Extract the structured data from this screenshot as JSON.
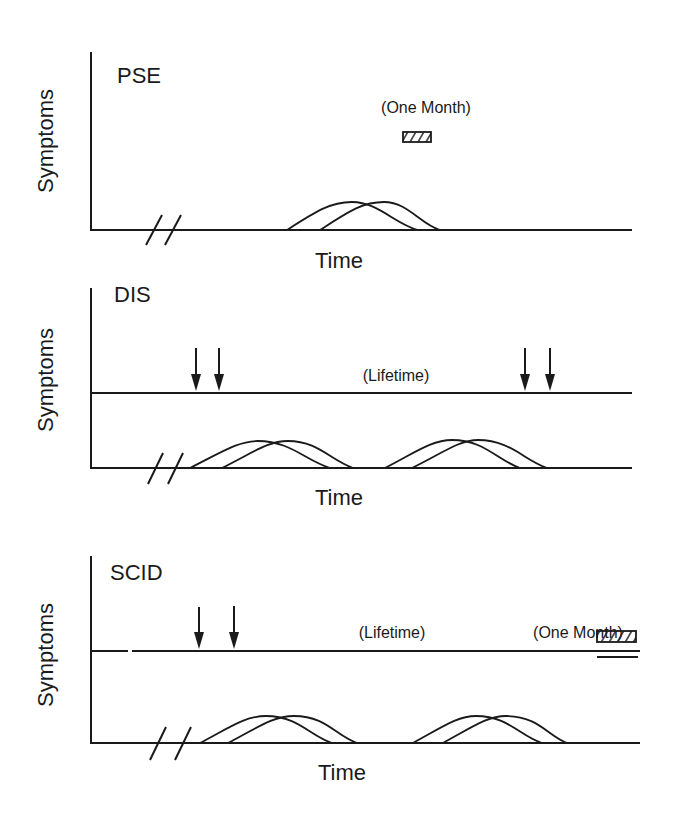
{
  "panels": [
    {
      "id": "pse",
      "title": "PSE",
      "ylabel": "Symptoms",
      "xlabel": "Time",
      "annotations": [
        {
          "text": "(One Month)",
          "type": "window-box"
        }
      ],
      "has_lifetime_line": false,
      "arrows": 0,
      "episode_pairs": 1
    },
    {
      "id": "dis",
      "title": "DIS",
      "ylabel": "Symptoms",
      "xlabel": "Time",
      "annotations": [
        {
          "text": "(Lifetime)",
          "type": "label"
        }
      ],
      "has_lifetime_line": true,
      "arrows": 4,
      "episode_pairs": 2
    },
    {
      "id": "scid",
      "title": "SCID",
      "ylabel": "Symptoms",
      "xlabel": "Time",
      "annotations": [
        {
          "text": "(Lifetime)",
          "type": "label"
        },
        {
          "text": "(One Month)",
          "type": "window-box"
        }
      ],
      "has_lifetime_line": true,
      "arrows": 2,
      "episode_pairs": 2
    }
  ],
  "colors": {
    "ink": "#1a1a1a",
    "background": "#ffffff"
  }
}
